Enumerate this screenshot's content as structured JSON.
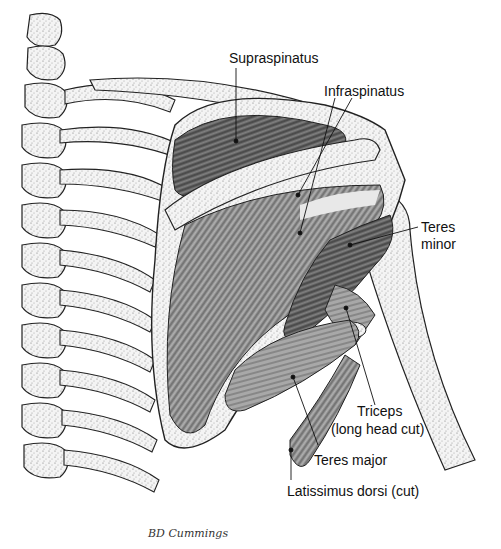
{
  "figure": {
    "signature": "BD Cummings"
  },
  "labels": {
    "supraspinatus": "Supraspinatus",
    "infraspinatus": "Infraspinatus",
    "teres_minor_1": "Teres",
    "teres_minor_2": "minor",
    "triceps_1": "Triceps",
    "triceps_2": "(long head cut)",
    "teres_major": "Teres major",
    "latissimus": "Latissimus dorsi (cut)"
  },
  "colors": {
    "ink": "#111111",
    "bone": "#f2f2f2",
    "muscle_dark": "#5a5a5a",
    "muscle_mid": "#8a8a8a",
    "muscle_light": "#b5b5b5"
  }
}
